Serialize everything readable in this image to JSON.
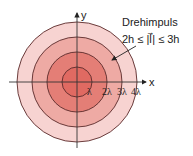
{
  "diagram": {
    "title": "Drehimpuls",
    "condition": "2h ≤ |l⃗| ≤ 3h",
    "axes": {
      "x_label": "x",
      "y_label": "y"
    },
    "ticks": [
      "λ",
      "2λ",
      "3λ",
      "4λ"
    ],
    "rings": [
      {
        "radius_units": 1,
        "fill": "#e06a62"
      },
      {
        "radius_units": 2,
        "fill": "#e57f77"
      },
      {
        "radius_units": 3,
        "fill": "#eea5a0"
      },
      {
        "radius_units": 4,
        "fill": "#f7d3d1"
      }
    ],
    "colors": {
      "outline": "#5a2a2a",
      "axis": "#333333"
    }
  }
}
